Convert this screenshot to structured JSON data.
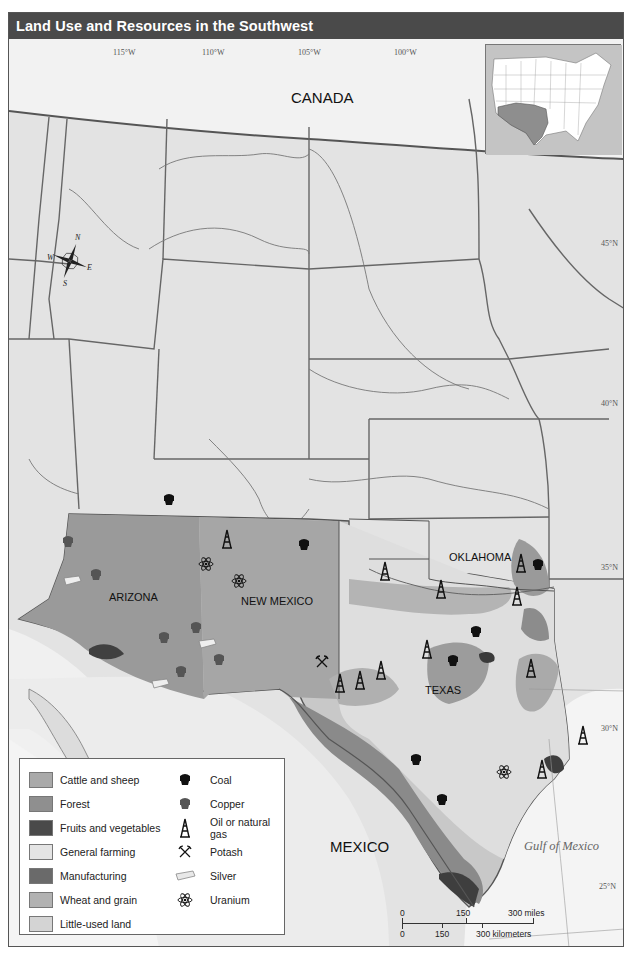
{
  "title": "Land Use and Resources in the Southwest",
  "longitude_labels": [
    "115°W",
    "110°W",
    "105°W",
    "100°W",
    "95°W",
    "90°W"
  ],
  "latitude_labels": [
    "50°N",
    "45°N",
    "40°N",
    "35°N",
    "30°N",
    "25°N"
  ],
  "place_labels": {
    "canada": "CANADA",
    "mexico": "MEXICO",
    "arizona": "ARIZONA",
    "new_mexico": "NEW MEXICO",
    "oklahoma": "OKLAHOMA",
    "texas": "TEXAS",
    "gulf": "Gulf of Mexico"
  },
  "compass": {
    "n": "N",
    "s": "S",
    "e": "E",
    "w": "W"
  },
  "inset": {
    "description": "U.S. locator map with Southwest region (Arizona, New Mexico, Oklahoma, Texas) highlighted"
  },
  "legend": {
    "land_use": [
      {
        "label": "Cattle and sheep",
        "color": "#a9a9a9"
      },
      {
        "label": "Forest",
        "color": "#8f8f8f"
      },
      {
        "label": "Fruits and vegetables",
        "color": "#4a4a4a"
      },
      {
        "label": "General farming",
        "color": "#e4e4e4"
      },
      {
        "label": "Manufacturing",
        "color": "#6a6a6a"
      },
      {
        "label": "Wheat and grain",
        "color": "#b2b2b2"
      },
      {
        "label": "Little-used land",
        "color": "#d4d4d4"
      }
    ],
    "resources": [
      {
        "label": "Coal",
        "icon": "coal-icon"
      },
      {
        "label": "Copper",
        "icon": "copper-icon"
      },
      {
        "label": "Oil or natural gas",
        "icon": "oil-derrick-icon"
      },
      {
        "label": "Potash",
        "icon": "potash-icon"
      },
      {
        "label": "Silver",
        "icon": "silver-bar-icon"
      },
      {
        "label": "Uranium",
        "icon": "uranium-icon"
      }
    ]
  },
  "scale_bar": {
    "miles": [
      "0",
      "150",
      "300 miles"
    ],
    "kilometers": [
      "0",
      "150",
      "300 kilometers"
    ]
  },
  "colors": {
    "title_bar": "#4a4a4a",
    "land": "#e6e6e6",
    "water": "#f2f2f2",
    "border": "#555555"
  }
}
